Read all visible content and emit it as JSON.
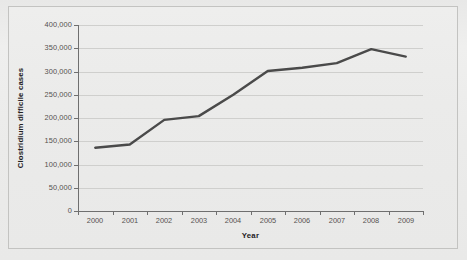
{
  "chart_data": {
    "type": "line",
    "title": "",
    "xlabel": "Year",
    "ylabel": "Clostridium difficile cases",
    "categories": [
      "2000",
      "2001",
      "2002",
      "2003",
      "2004",
      "2005",
      "2006",
      "2007",
      "2008",
      "2009"
    ],
    "x": [
      2000,
      2001,
      2002,
      2003,
      2004,
      2005,
      2006,
      2007,
      2008,
      2009
    ],
    "series": [
      {
        "name": "Clostridium difficile cases",
        "values": [
          136000,
          143000,
          196000,
          204000,
          250000,
          301000,
          308000,
          318000,
          348000,
          332000
        ],
        "color": "#4a4a4a"
      }
    ],
    "ylim": [
      0,
      400000
    ],
    "yticks": [
      0,
      50000,
      100000,
      150000,
      200000,
      250000,
      300000,
      350000,
      400000
    ],
    "ytick_labels": [
      "0",
      "50,000",
      "100,000",
      "150,000",
      "200,000",
      "250,000",
      "300,000",
      "350,000",
      "400,000"
    ],
    "xlim": [
      2000,
      2009
    ],
    "grid": "horizontal",
    "legend": "none",
    "legend_position": "none",
    "plot_background": "#ebebea",
    "gridline_color": "#cfcfcd",
    "axis_color": "#6f6f6f"
  }
}
